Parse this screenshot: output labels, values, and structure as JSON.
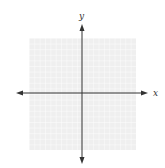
{
  "diagram": {
    "type": "coordinate-plane",
    "axes": {
      "x_label": "x",
      "y_label": "y",
      "origin_px": [
        82,
        93
      ],
      "arrows": "both-ends"
    },
    "grid": {
      "left": 29,
      "top": 38,
      "right": 136,
      "bottom": 150,
      "cells_per_side": 20,
      "background_color": "#efefef",
      "line_color": "#ffffff"
    },
    "colors": {
      "axis": "#333333",
      "label": "#333333"
    }
  }
}
